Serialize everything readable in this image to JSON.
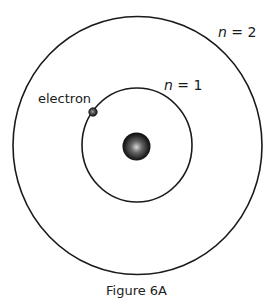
{
  "diagram": {
    "caption": "Figure 6A",
    "orbits": [
      {
        "label_var": "n",
        "label_eq": " = ",
        "label_value": "1",
        "radius": 56
      },
      {
        "label_var": "n",
        "label_eq": " = ",
        "label_value": "2",
        "radius": 126
      }
    ],
    "electron_label": "electron",
    "colors": {
      "line": "#1a1a1a",
      "nucleus_dark": "#111111",
      "nucleus_highlight": "#cfcfcf",
      "background": "#ffffff"
    }
  }
}
